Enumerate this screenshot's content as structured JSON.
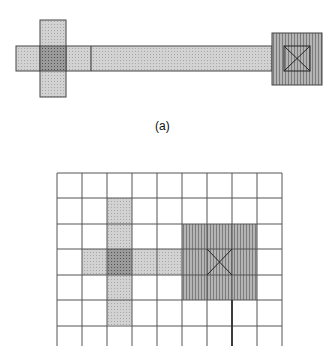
{
  "figure_a": {
    "caption": "(a)",
    "colors": {
      "poly_light": "#c9c9c9",
      "overlap_dark": "#8e8e8e",
      "contact": "#9a9a9a",
      "stroke": "#3a3a3a"
    }
  },
  "figure_b": {
    "grid": {
      "columns": 9,
      "rows": 7,
      "cell_size": 25
    },
    "regions": [
      {
        "name": "vertical-poly",
        "col": 2,
        "row_start": 1,
        "row_end": 5
      },
      {
        "name": "horizontal-poly",
        "row": 3,
        "col_start": 1,
        "col_end": 4
      },
      {
        "name": "overlap",
        "col": 2,
        "row": 3
      },
      {
        "name": "contact-pad",
        "col_start": 5,
        "col_end": 7,
        "row_start": 2,
        "row_end": 4
      },
      {
        "name": "contact-via",
        "col": 6,
        "row": 3
      }
    ]
  }
}
